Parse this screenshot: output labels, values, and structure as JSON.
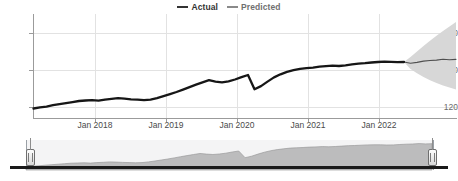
{
  "legend": {
    "items": [
      {
        "label": "Actual",
        "color": "#333333"
      },
      {
        "label": "Predicted",
        "color": "#8a8a8a"
      }
    ]
  },
  "axes": {
    "y_ticks": [
      "160",
      "140",
      "120"
    ],
    "x_ticks": [
      "Jan 2018",
      "Jan 2019",
      "Jan 2020",
      "Jan 2021",
      "Jan 2022"
    ]
  },
  "navigator": {
    "left_handle_label": "navigator-left-handle",
    "right_handle_label": "navigator-right-handle"
  },
  "chart_data": {
    "type": "line",
    "title": "",
    "xlabel": "",
    "ylabel": "",
    "ylim": [
      108,
      168
    ],
    "xlim": [
      "2017-07",
      "2022-12"
    ],
    "grid": true,
    "legend_position": "top-center",
    "x_tick_labels": [
      "Jan 2018",
      "Jan 2019",
      "Jan 2020",
      "Jan 2021",
      "Jan 2022"
    ],
    "y_tick_values": [
      120,
      140,
      160
    ],
    "series": [
      {
        "name": "Actual",
        "color": "#1f1f1f",
        "x": [
          "2017-07",
          "2017-08",
          "2017-09",
          "2017-10",
          "2017-11",
          "2017-12",
          "2018-01",
          "2018-02",
          "2018-03",
          "2018-04",
          "2018-05",
          "2018-06",
          "2018-07",
          "2018-08",
          "2018-09",
          "2018-10",
          "2018-11",
          "2018-12",
          "2019-01",
          "2019-02",
          "2019-03",
          "2019-04",
          "2019-05",
          "2019-06",
          "2019-07",
          "2019-08",
          "2019-09",
          "2019-10",
          "2019-11",
          "2019-12",
          "2020-01",
          "2020-02",
          "2020-03",
          "2020-04",
          "2020-05",
          "2020-06",
          "2020-07",
          "2020-08",
          "2020-09",
          "2020-10",
          "2020-11",
          "2020-12",
          "2021-01",
          "2021-02",
          "2021-03",
          "2021-04",
          "2021-05",
          "2021-06",
          "2021-07",
          "2021-08",
          "2021-09",
          "2021-10",
          "2021-11",
          "2021-12",
          "2022-01",
          "2022-02",
          "2022-03",
          "2022-04"
        ],
        "values": [
          113.5,
          114.2,
          114.6,
          115.4,
          116.0,
          116.6,
          117.2,
          117.8,
          118.1,
          118.3,
          118.0,
          118.6,
          119.0,
          119.4,
          119.2,
          118.8,
          118.6,
          118.3,
          118.6,
          119.4,
          120.6,
          121.8,
          123.0,
          124.4,
          125.8,
          127.2,
          128.6,
          129.8,
          129.0,
          128.6,
          129.2,
          130.2,
          131.6,
          132.8,
          124.6,
          126.4,
          129.0,
          131.4,
          133.2,
          134.6,
          135.6,
          136.4,
          136.8,
          137.1,
          137.6,
          137.9,
          138.2,
          138.0,
          138.4,
          138.9,
          139.3,
          139.6,
          140.0,
          140.3,
          140.5,
          140.4,
          140.2,
          140.3
        ]
      },
      {
        "name": "Predicted",
        "color": "#5a5a5a",
        "x": [
          "2022-04",
          "2022-05",
          "2022-06",
          "2022-07",
          "2022-08",
          "2022-09",
          "2022-10",
          "2022-11",
          "2022-12"
        ],
        "values": [
          140.3,
          139.6,
          140.1,
          140.8,
          141.2,
          141.4,
          141.9,
          141.6,
          141.8
        ],
        "confidence_band": {
          "label": "prediction-interval",
          "color": "#d5d5d5",
          "lower": [
            140.3,
            136.2,
            133.8,
            131.6,
            129.8,
            128.2,
            126.8,
            125.6,
            124.4
          ],
          "upper": [
            140.3,
            143.2,
            146.4,
            149.6,
            152.6,
            155.4,
            158.2,
            160.8,
            163.4
          ]
        }
      }
    ],
    "navigator_series": {
      "name": "Navigator overview",
      "type": "area",
      "color": "#b6b6b6",
      "values": [
        113.5,
        114.2,
        114.6,
        115.4,
        116.0,
        116.6,
        117.2,
        117.8,
        118.1,
        118.3,
        118.0,
        118.6,
        119.0,
        119.4,
        119.2,
        118.8,
        118.6,
        118.3,
        118.6,
        119.4,
        120.6,
        121.8,
        123.0,
        124.4,
        125.8,
        127.2,
        128.6,
        129.8,
        129.0,
        128.6,
        129.2,
        130.2,
        131.6,
        132.8,
        124.6,
        126.4,
        129.0,
        131.4,
        133.2,
        134.6,
        135.6,
        136.4,
        136.8,
        137.1,
        137.6,
        137.9,
        138.2,
        138.0,
        138.4,
        138.9,
        139.3,
        139.6,
        140.0,
        140.3,
        140.5,
        140.4,
        140.2,
        140.3,
        140.8,
        141.2,
        141.4,
        141.9,
        141.6,
        141.8
      ]
    }
  }
}
